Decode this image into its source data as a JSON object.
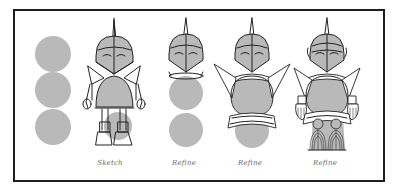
{
  "figure": {
    "colors": {
      "frame": "#1e1e1e",
      "circle_fill": "#b9b9b9",
      "line": "#222222",
      "label": "#6a6a6a",
      "background": "#ffffff"
    },
    "stages": [
      {
        "id": "shapes",
        "label": ""
      },
      {
        "id": "sketch",
        "label": "Sketch"
      },
      {
        "id": "refine-1",
        "label": "Refine"
      },
      {
        "id": "refine-2",
        "label": "Refine"
      },
      {
        "id": "refine-3",
        "label": "Refine"
      }
    ]
  }
}
